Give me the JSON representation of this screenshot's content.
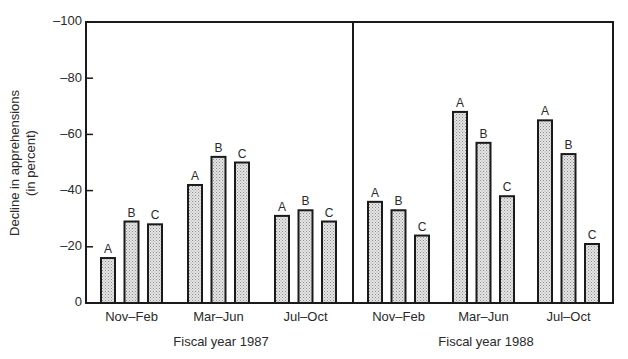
{
  "chart_data": {
    "type": "bar",
    "title": "",
    "ylabel": "Decline in apprehensions (in percent)",
    "ylabel_lines": [
      "Decline in apprehensions",
      "(in percent)"
    ],
    "xlabel": "",
    "ylim": [
      0,
      -100
    ],
    "yticks": [
      0,
      -20,
      -40,
      -60,
      -80,
      -100
    ],
    "ytick_labels": [
      "0",
      "–20",
      "–40",
      "–60",
      "–80",
      "–100"
    ],
    "grid": false,
    "legend": null,
    "series_labels": [
      "A",
      "B",
      "C"
    ],
    "panels": [
      {
        "label": "Fiscal year 1987",
        "categories": [
          "Nov–Feb",
          "Mar–Jun",
          "Jul–Oct"
        ],
        "series": [
          {
            "name": "A",
            "values": [
              -16,
              -42,
              -31
            ]
          },
          {
            "name": "B",
            "values": [
              -29,
              -52,
              -33
            ]
          },
          {
            "name": "C",
            "values": [
              -28,
              -50,
              -29
            ]
          }
        ]
      },
      {
        "label": "Fiscal year 1988",
        "categories": [
          "Nov–Feb",
          "Mar–Jun",
          "Jul–Oct"
        ],
        "series": [
          {
            "name": "A",
            "values": [
              -36,
              -68,
              -65
            ]
          },
          {
            "name": "B",
            "values": [
              -33,
              -57,
              -53
            ]
          },
          {
            "name": "C",
            "values": [
              -24,
              -38,
              -21
            ]
          }
        ]
      }
    ]
  },
  "style": {
    "bar_fill": "#d4d4d4",
    "stroke": "#1a1a1a",
    "text": "#2a2a2a"
  }
}
